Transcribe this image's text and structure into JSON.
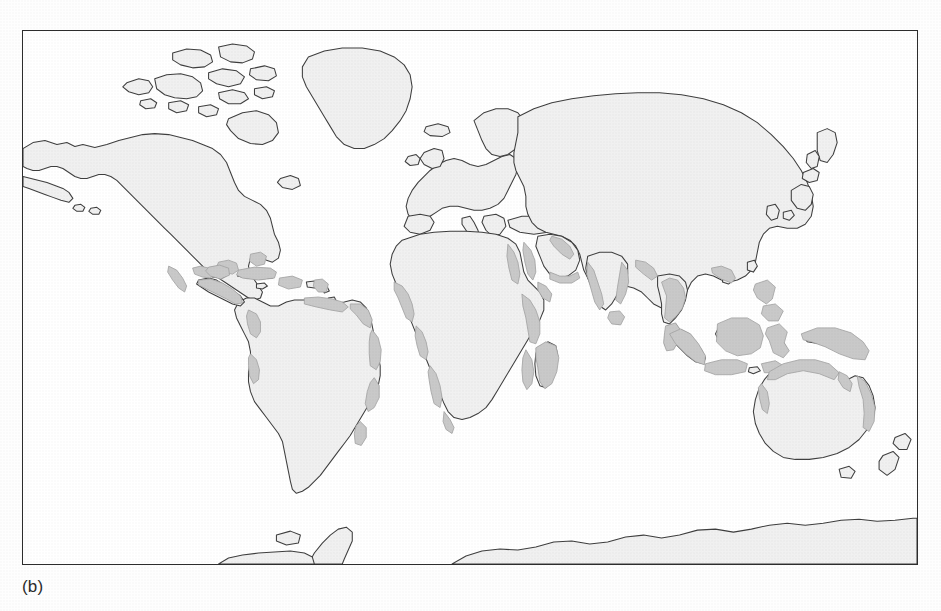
{
  "figure": {
    "caption": "(b)",
    "panel_label": "b"
  },
  "map": {
    "title": "",
    "projection": "rectangular world map",
    "colors": {
      "background": "#ffffff",
      "land_fill": "#f0f0f0",
      "land_outline": "#3a3a3a",
      "highlight_fill": "#c8c8c8",
      "highlight_outline": "#9a9a9a",
      "frame_border": "#2c2c2c",
      "caption_text": "#2b2b2b"
    },
    "frame": {
      "x": 22,
      "y": 30,
      "width": 896,
      "height": 535
    },
    "legend": {
      "visible": false,
      "entries": []
    },
    "axis_labels": [],
    "graticule": {
      "visible": false
    },
    "highlight_description": "shaded coastal bands along tropical latitudes",
    "highlighted_regions": [
      "Gulf of Mexico coast",
      "Caribbean islands",
      "Central America",
      "northern South America",
      "eastern Brazil coast",
      "Pacific coast of Ecuador and Peru",
      "West Africa / Gulf of Guinea",
      "East Africa coast",
      "Madagascar",
      "Red Sea",
      "Persian Gulf",
      "western India",
      "Sri Lanka",
      "Bay of Bengal coast",
      "Southeast Asia",
      "Indonesia",
      "Philippines",
      "New Guinea",
      "northern Australia",
      "northeastern Australia"
    ],
    "unshaded_regions": [
      "North America interior",
      "Greenland",
      "Europe",
      "northern Asia",
      "Antarctica"
    ]
  }
}
